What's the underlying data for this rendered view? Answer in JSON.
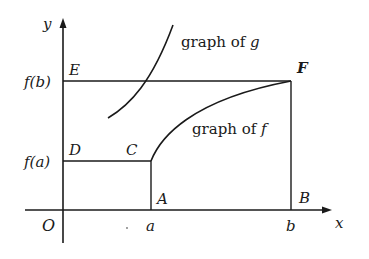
{
  "diagram": {
    "axes": {
      "x_label": "x",
      "y_label": "y",
      "origin_label": "O"
    },
    "tick_labels": {
      "x": [
        "a",
        "b"
      ],
      "y": [
        "f(a)",
        "f(b)"
      ]
    },
    "points": {
      "A": "A",
      "B": "B",
      "C": "C",
      "D": "D",
      "E": "E",
      "F": "F"
    },
    "curve_labels": {
      "g": {
        "prefix": "graph of ",
        "name": "g"
      },
      "f": {
        "prefix": "graph of ",
        "name": "f"
      }
    },
    "colors": {
      "line": "#1a1a1a",
      "background": "#ffffff"
    }
  }
}
